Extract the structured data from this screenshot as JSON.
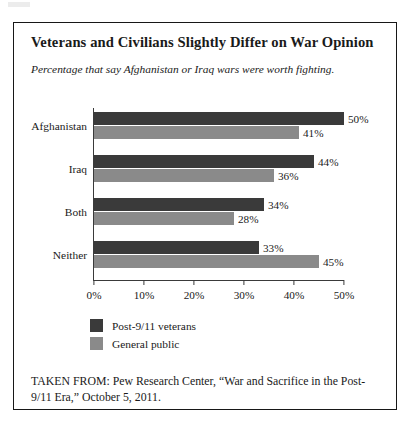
{
  "figure": {
    "title": "Veterans and Civilians Slightly Differ on War Opinion",
    "subtitle": "Percentage that say Afghanistan or Iraq wars were worth fighting.",
    "source_note": "TAKEN FROM: Pew Research Center, “War and Sacrifice in the Post-9/11 Era,” October 5, 2011."
  },
  "colors": {
    "veterans": "#3a3a3a",
    "public": "#8a8a8a",
    "axis": "#3a3a3a",
    "frame": "#171717"
  },
  "chart_data": {
    "type": "bar",
    "orientation": "horizontal",
    "title": "Veterans and Civilians Slightly Differ on War Opinion",
    "subtitle": "Percentage that say Afghanistan or Iraq wars were worth fighting.",
    "xlabel": "",
    "ylabel": "",
    "xlim": [
      0,
      50
    ],
    "xticks": [
      0,
      10,
      20,
      30,
      40,
      50
    ],
    "xtick_labels": [
      "0%",
      "10%",
      "20%",
      "30%",
      "40%",
      "50%"
    ],
    "grid": false,
    "legend_position": "bottom-left",
    "categories": [
      "Afghanistan",
      "Iraq",
      "Both",
      "Neither"
    ],
    "series": [
      {
        "name": "Post-9/11 veterans",
        "color": "#3a3a3a",
        "values": [
          50,
          44,
          34,
          33
        ],
        "labels": [
          "50%",
          "44%",
          "34%",
          "33%"
        ]
      },
      {
        "name": "General public",
        "color": "#8a8a8a",
        "values": [
          41,
          36,
          28,
          45
        ],
        "labels": [
          "41%",
          "36%",
          "28%",
          "45%"
        ]
      }
    ]
  }
}
